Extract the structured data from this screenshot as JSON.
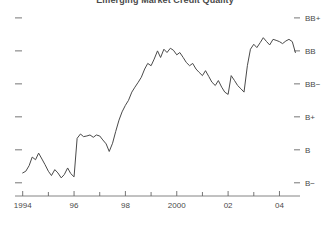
{
  "chart_data": {
    "type": "line",
    "title": "Emerging Market Credit Quality",
    "xlabel": "",
    "ylabel": "",
    "grid": false,
    "legend": "none",
    "y_tick_labels": [
      "BB+",
      "BB",
      "BB−",
      "B+",
      "B",
      "B−"
    ],
    "y_tick_values": [
      9,
      8,
      7,
      6,
      5,
      4
    ],
    "ylim": [
      3.6,
      9.3
    ],
    "x_tick_labels": [
      "1994",
      "96",
      "98",
      "2000",
      "02",
      "04"
    ],
    "x_tick_values": [
      1994,
      1996,
      1998,
      2000,
      2002,
      2004
    ],
    "x_minor_ticks": [
      1995,
      1997,
      1999,
      2001,
      2003
    ],
    "xlim": [
      1993.7,
      2004.8
    ],
    "series": [
      {
        "name": "Emerging Market Credit Quality",
        "color": "#4a4a4a",
        "x": [
          1994.0,
          1994.12,
          1994.25,
          1994.37,
          1994.5,
          1994.62,
          1994.75,
          1994.87,
          1995.0,
          1995.12,
          1995.25,
          1995.37,
          1995.5,
          1995.62,
          1995.75,
          1995.87,
          1996.0,
          1996.12,
          1996.25,
          1996.37,
          1996.5,
          1996.62,
          1996.75,
          1996.87,
          1997.0,
          1997.12,
          1997.25,
          1997.37,
          1997.5,
          1997.62,
          1997.75,
          1997.87,
          1998.0,
          1998.12,
          1998.25,
          1998.37,
          1998.5,
          1998.62,
          1998.75,
          1998.87,
          1999.0,
          1999.12,
          1999.25,
          1999.37,
          1999.5,
          1999.62,
          1999.75,
          1999.87,
          2000.0,
          2000.12,
          2000.25,
          2000.37,
          2000.5,
          2000.62,
          2000.75,
          2000.87,
          2001.0,
          2001.12,
          2001.25,
          2001.37,
          2001.5,
          2001.62,
          2001.75,
          2001.87,
          2002.0,
          2002.12,
          2002.25,
          2002.37,
          2002.5,
          2002.62,
          2002.75,
          2002.87,
          2003.0,
          2003.12,
          2003.25,
          2003.37,
          2003.5,
          2003.62,
          2003.75,
          2003.87,
          2004.0,
          2004.12,
          2004.25,
          2004.37,
          2004.5,
          2004.62
        ],
        "y": [
          4.3,
          4.35,
          4.52,
          4.78,
          4.7,
          4.9,
          4.72,
          4.55,
          4.35,
          4.22,
          4.4,
          4.3,
          4.15,
          4.25,
          4.45,
          4.28,
          4.18,
          5.35,
          5.48,
          5.4,
          5.42,
          5.45,
          5.38,
          5.45,
          5.42,
          5.3,
          5.18,
          4.95,
          5.2,
          5.55,
          5.9,
          6.15,
          6.35,
          6.5,
          6.75,
          6.9,
          7.05,
          7.2,
          7.45,
          7.62,
          7.55,
          7.75,
          8.0,
          7.8,
          8.05,
          7.95,
          8.08,
          8.02,
          7.88,
          7.95,
          7.8,
          7.65,
          7.55,
          7.62,
          7.45,
          7.35,
          7.25,
          7.4,
          7.22,
          7.05,
          6.95,
          7.1,
          6.9,
          6.75,
          6.68,
          7.25,
          7.1,
          6.95,
          6.85,
          6.75,
          7.55,
          8.05,
          8.2,
          8.1,
          8.25,
          8.4,
          8.28,
          8.18,
          8.35,
          8.32,
          8.28,
          8.22,
          8.3,
          8.35,
          8.28,
          7.95
        ]
      }
    ]
  }
}
